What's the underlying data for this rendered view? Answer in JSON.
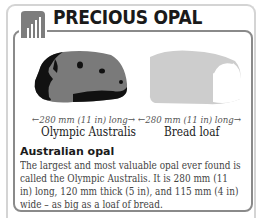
{
  "title": "PRECIOUS OPAL",
  "icon": "hand-chart-icon",
  "colors": {
    "outer_frame": "#d4d4d4",
    "inner_frame": "#8a8a8a",
    "opal_body": "#7a7a7a",
    "opal_dark": "#111111",
    "loaf": "#cccccc"
  },
  "figures": [
    {
      "name": "Olympic Australis",
      "measure": "←280 mm (11 in) long→",
      "shape": "opal-icon"
    },
    {
      "name": "Bread loaf",
      "measure": "←280 mm (11 in) long→",
      "shape": "bread-loaf-icon"
    }
  ],
  "section": {
    "heading": "Australian opal",
    "body": "The largest and most valuable opal ever found is called the Olympic Australis. It is 280 mm (11 in) long, 120 mm thick (5 in), and 115 mm (4 in) wide – as big as a loaf of bread."
  }
}
